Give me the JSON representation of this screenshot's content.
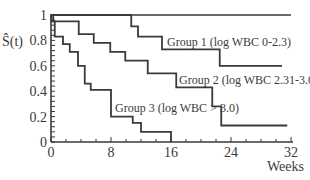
{
  "chart_data": {
    "type": "line",
    "subtype": "kaplan-meier-step",
    "title": "",
    "xlabel": "Weeks",
    "ylabel": "Ŝ(t)",
    "xlim": [
      0,
      32
    ],
    "ylim": [
      0,
      1
    ],
    "x_ticks": [
      0,
      8,
      16,
      24,
      32
    ],
    "x_tick_labels": [
      "0",
      "8",
      "16",
      "24",
      "32"
    ],
    "y_ticks": [
      0,
      0.2,
      0.4,
      0.6,
      0.8,
      1
    ],
    "y_tick_labels": [
      "0",
      "0.2",
      "0.4",
      "0.6",
      "0.8",
      "1"
    ],
    "grid": false,
    "legend": "inline labels",
    "reference_line": {
      "y": 1,
      "x_end": 32
    },
    "series": [
      {
        "name": "Group 1 (log WBC 0-2.3)",
        "steps": [
          {
            "t": 0,
            "s": 1.0
          },
          {
            "t": 10.7,
            "s": 0.91
          },
          {
            "t": 11.6,
            "s": 0.83
          },
          {
            "t": 14.8,
            "s": 0.73
          },
          {
            "t": 22.5,
            "s": 0.6
          }
        ],
        "end_t": 30.8
      },
      {
        "name": "Group 2 (log WBC 2.31-3.0)",
        "steps": [
          {
            "t": 0,
            "s": 1.0
          },
          {
            "t": 0.3,
            "s": 0.95
          },
          {
            "t": 3.7,
            "s": 0.85
          },
          {
            "t": 5.7,
            "s": 0.78
          },
          {
            "t": 7.9,
            "s": 0.71
          },
          {
            "t": 9.9,
            "s": 0.64
          },
          {
            "t": 12.9,
            "s": 0.54
          },
          {
            "t": 16.7,
            "s": 0.43
          },
          {
            "t": 21.5,
            "s": 0.28
          },
          {
            "t": 22.7,
            "s": 0.13
          }
        ],
        "end_t": 31.5
      },
      {
        "name": "Group 3 (log WBC > 3.0)",
        "steps": [
          {
            "t": 0,
            "s": 1.0
          },
          {
            "t": 0.05,
            "s": 0.95
          },
          {
            "t": 0.5,
            "s": 0.83
          },
          {
            "t": 1.6,
            "s": 0.77
          },
          {
            "t": 2.5,
            "s": 0.71
          },
          {
            "t": 3.6,
            "s": 0.6
          },
          {
            "t": 4.5,
            "s": 0.46
          },
          {
            "t": 5.3,
            "s": 0.41
          },
          {
            "t": 8.0,
            "s": 0.2
          },
          {
            "t": 10.9,
            "s": 0.15
          },
          {
            "t": 12.0,
            "s": 0.08
          },
          {
            "t": 16.0,
            "s": 0.0
          }
        ],
        "end_t": 16.0
      }
    ],
    "annotations": [
      {
        "text": "Group 1 (log WBC 0-2.3)",
        "x_px": 167,
        "y_px": 46
      },
      {
        "text": "Group 2 (log WBC 2.31-3.0)",
        "x_px": 179,
        "y_px": 84
      },
      {
        "text": "Group 3 (log WBC > 3.0)",
        "x_px": 115,
        "y_px": 112
      }
    ]
  }
}
